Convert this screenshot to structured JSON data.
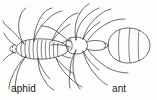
{
  "figure": {
    "kind": "line-drawing",
    "background_color": "#fdfdfc",
    "ink_color": "#2a2a2a",
    "labels": {
      "left": "aphid",
      "right": "ant"
    }
  },
  "specimens": [
    {
      "name": "aphid",
      "label": "aphid",
      "position": "left",
      "body_segments": 10,
      "legs": 6,
      "antennae": 2,
      "cornicles": 2,
      "view": "dorsal"
    },
    {
      "name": "ant",
      "label": "ant",
      "position": "right",
      "body_parts": [
        "head",
        "thorax",
        "petiole",
        "gaster"
      ],
      "gaster_segments": 4,
      "legs": 6,
      "antennae": 2,
      "view": "dorsal"
    }
  ]
}
